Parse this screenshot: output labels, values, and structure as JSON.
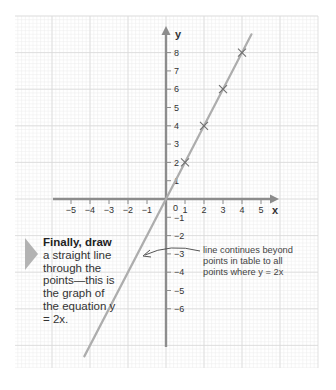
{
  "chart_data": {
    "type": "line",
    "title": "",
    "equation": "y = 2x",
    "xlabel": "x",
    "ylabel": "y",
    "xlim": [
      -5,
      5
    ],
    "ylim": [
      -6,
      8
    ],
    "x_ticks": [
      -5,
      -4,
      -3,
      -2,
      -1,
      0,
      1,
      2,
      3,
      4,
      5
    ],
    "y_ticks": [
      -6,
      -5,
      -4,
      -3,
      -2,
      -1,
      1,
      2,
      3,
      4,
      5,
      6,
      7,
      8
    ],
    "grid": true,
    "series": [
      {
        "name": "y = 2x",
        "line_extends_beyond_points": true,
        "points": [
          {
            "x": 1,
            "y": 2
          },
          {
            "x": 2,
            "y": 4
          },
          {
            "x": 3,
            "y": 6
          },
          {
            "x": 4,
            "y": 8
          }
        ],
        "marker": "x"
      }
    ],
    "annotations": [
      "line continues beyond points in table to all points where y = 2x"
    ]
  },
  "axes": {
    "x_label": "x",
    "y_label": "y",
    "origin_label": "0"
  },
  "callout": {
    "bold": "Finally, draw",
    "rest": "a straight line through the points—this is the graph of the equation y = 2x."
  },
  "annotation": {
    "text": "line continues beyond points in table to all points where y = 2x"
  },
  "colors": {
    "grid_minor": "#ececec",
    "grid_major": "#d9d9d9",
    "axis": "#8c8c8c",
    "line": "#adadad",
    "marker": "#6e6e6e",
    "triangle": "#b3b3b3",
    "text": "#333333"
  }
}
